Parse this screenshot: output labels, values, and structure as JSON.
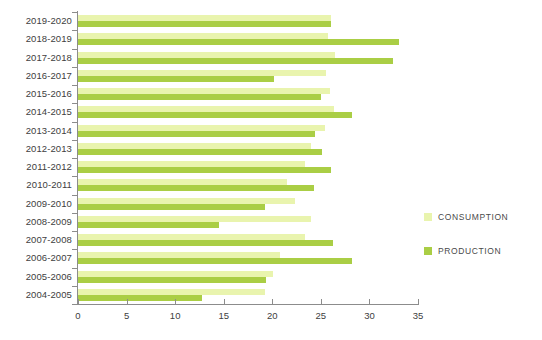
{
  "chart_data": {
    "type": "bar",
    "orientation": "horizontal",
    "title": "",
    "xlabel": "",
    "ylabel": "",
    "xlim": [
      0,
      35
    ],
    "xticks": [
      0,
      5,
      10,
      15,
      20,
      25,
      30,
      35
    ],
    "grid": false,
    "legend_position": "right",
    "categories": [
      "2019-2020",
      "2018-2019",
      "2017-2018",
      "2016-2017",
      "2015-2016",
      "2014-2015",
      "2013-2014",
      "2012-2013",
      "2011-2012",
      "2010-2011",
      "2009-2010",
      "2008-2009",
      "2007-2008",
      "2006-2007",
      "2005-2006",
      "2004-2005"
    ],
    "series": [
      {
        "name": "CONSUMPTION",
        "color": "#e9f4ae",
        "values": [
          26.0,
          25.7,
          26.5,
          25.5,
          25.9,
          26.4,
          25.4,
          24.0,
          23.4,
          21.5,
          22.3,
          24.0,
          23.4,
          20.8,
          20.1,
          19.3
        ]
      },
      {
        "name": "PRODUCTION",
        "color": "#aace45",
        "values": [
          26.0,
          33.0,
          32.4,
          20.2,
          25.0,
          28.2,
          24.4,
          25.1,
          26.0,
          24.3,
          19.2,
          14.5,
          26.2,
          28.2,
          19.4,
          12.8
        ]
      }
    ]
  },
  "legend": {
    "items": [
      {
        "label": "CONSUMPTION",
        "color": "#e9f4ae"
      },
      {
        "label": "PRODUCTION",
        "color": "#aace45"
      }
    ]
  },
  "axis": {
    "x_tick_labels": [
      "0",
      "5",
      "10",
      "15",
      "20",
      "25",
      "30",
      "35"
    ]
  }
}
